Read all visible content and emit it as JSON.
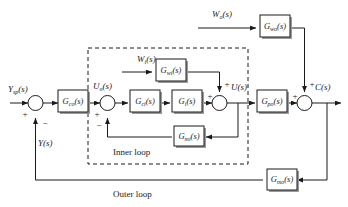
{
  "diagram": {
    "loops": {
      "inner_label": "Inner loop",
      "outer_label": "Outer loop"
    },
    "blocks": [
      {
        "id": "gco",
        "base": "G",
        "sub": "co",
        "arg": "(s)",
        "full": "Gco(s)",
        "role": "outer-controller"
      },
      {
        "id": "gci",
        "base": "G",
        "sub": "ci",
        "arg": "(s)",
        "full": "Gci(s)",
        "role": "inner-controller"
      },
      {
        "id": "gi",
        "base": "G",
        "sub": "i",
        "arg": "(s)",
        "full": "Gi(s)",
        "role": "inner-process"
      },
      {
        "id": "gwi",
        "base": "G",
        "sub": "wi",
        "arg": "(s)",
        "full": "Gwi(s)",
        "role": "inner-disturbance-transfer"
      },
      {
        "id": "gmi",
        "base": "G",
        "sub": "mi",
        "arg": "(s)",
        "full": "Gmi(s)",
        "role": "inner-measurement"
      },
      {
        "id": "gwo",
        "base": "G",
        "sub": "wo",
        "arg": "(s)",
        "full": "Gwo(s)",
        "role": "outer-disturbance-transfer"
      },
      {
        "id": "gpo",
        "base": "G",
        "sub": "po",
        "arg": "(s)",
        "full": "Gpo(s)",
        "role": "outer-process"
      },
      {
        "id": "gmo",
        "base": "G",
        "sub": "mo",
        "arg": "(s)",
        "full": "Gmo(s)",
        "role": "outer-measurement"
      }
    ],
    "signals": [
      {
        "id": "ysp",
        "base": "Y",
        "sub": "sp",
        "arg": "(s)",
        "full": "Ysp(s)",
        "role": "setpoint-input"
      },
      {
        "id": "uo",
        "base": "U",
        "sub": "o",
        "arg": "(s)",
        "full": "Uo(s)",
        "role": "outer-controller-output"
      },
      {
        "id": "wi",
        "base": "W",
        "sub": "i",
        "arg": "(s)",
        "full": "Wi(s)",
        "role": "inner-disturbance-input"
      },
      {
        "id": "wo",
        "base": "W",
        "sub": "o",
        "arg": "(s)",
        "full": "Wo(s)",
        "role": "outer-disturbance-input"
      },
      {
        "id": "u",
        "base": "U",
        "sub": "",
        "arg": "(s)",
        "full": "U(s)",
        "role": "inner-loop-output"
      },
      {
        "id": "c",
        "base": "C",
        "sub": "",
        "arg": "(s)",
        "full": "C(s)",
        "role": "controlled-output"
      },
      {
        "id": "y",
        "base": "Y",
        "sub": "",
        "arg": "(s)",
        "full": "Y(s)",
        "role": "measured-output-feedback"
      }
    ],
    "summers": [
      {
        "id": "sum-outer-error",
        "signs": [
          "+",
          "-"
        ]
      },
      {
        "id": "sum-inner-error",
        "signs": [
          "+",
          "-"
        ]
      },
      {
        "id": "sum-inner-dist",
        "signs": [
          "+",
          "+"
        ]
      },
      {
        "id": "sum-outer-dist",
        "signs": [
          "+",
          "+"
        ]
      }
    ],
    "signs": {
      "plus": "+",
      "minus": "−"
    },
    "colors": {
      "line": "#1a1a1a",
      "block_fill": "#ffffff",
      "shadow": "#9a9a9a",
      "background": "#ffffff"
    }
  }
}
